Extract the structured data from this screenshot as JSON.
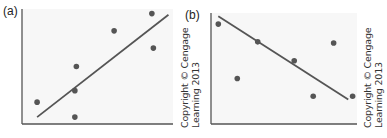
{
  "figure": {
    "panels": [
      {
        "label": "(a)"
      },
      {
        "label": "(b)"
      }
    ],
    "copyright": {
      "line1": "Copyright © Cengage",
      "line2": "Learning 2013"
    }
  },
  "colors": {
    "axis": "#555555",
    "point": "#555555",
    "line": "#555555",
    "plot_bg": "#f7f7f7"
  },
  "chart_data": [
    {
      "type": "scatter",
      "title": "(a)",
      "xlabel": "",
      "ylabel": "",
      "grid": false,
      "trend_line": {
        "direction": "positive",
        "from": [
          0.1,
          0.06
        ],
        "to": [
          0.97,
          0.95
        ]
      },
      "points": [
        {
          "x": 0.1,
          "y": 0.19
        },
        {
          "x": 0.36,
          "y": 0.5
        },
        {
          "x": 0.35,
          "y": 0.29
        },
        {
          "x": 0.35,
          "y": 0.06
        },
        {
          "x": 0.61,
          "y": 0.81
        },
        {
          "x": 0.86,
          "y": 0.96
        },
        {
          "x": 0.87,
          "y": 0.66
        }
      ]
    },
    {
      "type": "scatter",
      "title": "(b)",
      "xlabel": "",
      "ylabel": "",
      "grid": false,
      "trend_line": {
        "direction": "negative",
        "from": [
          0.05,
          0.97
        ],
        "to": [
          0.94,
          0.22
        ]
      },
      "points": [
        {
          "x": 0.05,
          "y": 0.9
        },
        {
          "x": 0.18,
          "y": 0.41
        },
        {
          "x": 0.32,
          "y": 0.74
        },
        {
          "x": 0.57,
          "y": 0.57
        },
        {
          "x": 0.7,
          "y": 0.25
        },
        {
          "x": 0.84,
          "y": 0.73
        },
        {
          "x": 0.97,
          "y": 0.25
        }
      ]
    }
  ]
}
